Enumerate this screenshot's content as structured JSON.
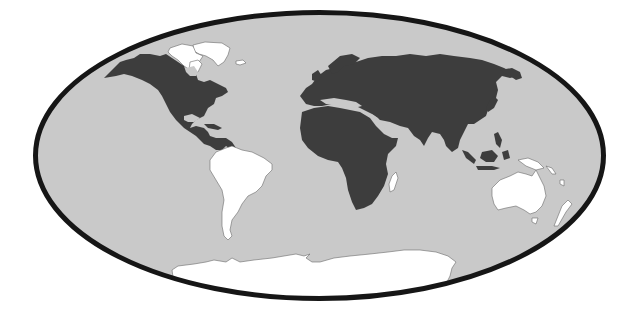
{
  "map": {
    "projection": "elliptical world map",
    "colors": {
      "background": "#ffffff",
      "ocean": "#c9c9c9",
      "highlighted_land": "#3d3d3d",
      "other_land": "#ffffff",
      "border": "#161616",
      "coastline": "#6a6a6a"
    },
    "highlighted_regions": [
      "North America",
      "Central America",
      "Europe",
      "Asia",
      "Africa",
      "Maritime Southeast Asia"
    ],
    "unhighlighted_regions": [
      "Greenland",
      "Arctic Canada",
      "South America",
      "Australia",
      "New Zealand",
      "Madagascar",
      "Antarctica",
      "Pacific Islands",
      "New Guinea"
    ]
  }
}
